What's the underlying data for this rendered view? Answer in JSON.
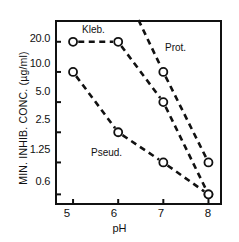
{
  "chart_data": {
    "type": "line",
    "title": "",
    "xlabel": "pH",
    "ylabel": "MIN. INHIB. CONC.  (µg/ml)",
    "x_ticks": [
      "5",
      "6",
      "7",
      "8"
    ],
    "x_tick_values": [
      5,
      6,
      7,
      8
    ],
    "xlim": [
      4.6,
      8.3
    ],
    "y_ticks": [
      "20.0",
      "10.0",
      "5.0",
      "2.5",
      "1.25",
      "0.6"
    ],
    "y_tick_values": [
      20.0,
      10.0,
      5.0,
      2.5,
      1.25,
      0.6
    ],
    "yscale": "log",
    "ylim": [
      0.47,
      33.0
    ],
    "grid": false,
    "legend": "inline-annotations",
    "marker": "open-circle",
    "linestyle": "dashed",
    "series": [
      {
        "name": "Kleb.",
        "label": "Kleb.",
        "x": [
          5,
          6,
          7,
          8
        ],
        "values": [
          20.0,
          20.0,
          5.0,
          0.6
        ]
      },
      {
        "name": "Prot.",
        "label": "Prot.",
        "x": [
          6.45,
          7,
          8
        ],
        "values": [
          33.0,
          10.0,
          1.25
        ],
        "note": "curve enters plot from above the top axis; first point is off-scale"
      },
      {
        "name": "Pseud.",
        "label": "Pseud.",
        "x": [
          5,
          6,
          7,
          8
        ],
        "values": [
          10.0,
          2.5,
          1.25,
          0.6
        ]
      }
    ]
  },
  "axis": {
    "x_title": "pH",
    "y_title": "MIN. INHIB. CONC.  (µg/ml)"
  },
  "colors": {
    "ink": "#111111",
    "background": "#ffffff"
  }
}
